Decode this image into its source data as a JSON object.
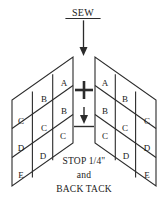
{
  "diagram": {
    "title_label": "SEW",
    "bottom_lines": [
      "STOP 1/4\"",
      "and",
      "BACK TACK"
    ],
    "colors": {
      "ink": "#2b2b2b",
      "background": "#ffffff"
    },
    "markers": {
      "plus": "+",
      "down_arrow": "down-arrow-with-stop-bar"
    },
    "left_patch": {
      "name": "left-parallelogram",
      "letters": [
        "A",
        "B",
        "B",
        "C",
        "C",
        "C",
        "D",
        "D",
        "E"
      ],
      "cells": [
        {
          "letter": "A",
          "x": 64,
          "y": 83
        },
        {
          "letter": "B",
          "x": 44,
          "y": 99
        },
        {
          "letter": "B",
          "x": 64,
          "y": 111
        },
        {
          "letter": "C",
          "x": 21,
          "y": 121
        },
        {
          "letter": "C",
          "x": 44,
          "y": 128
        },
        {
          "letter": "C",
          "x": 63,
          "y": 136
        },
        {
          "letter": "D",
          "x": 21,
          "y": 148
        },
        {
          "letter": "D",
          "x": 43,
          "y": 156
        },
        {
          "letter": "E",
          "x": 21,
          "y": 175
        }
      ]
    },
    "right_patch": {
      "name": "right-parallelogram",
      "letters": [
        "A",
        "B",
        "B",
        "C",
        "C",
        "C",
        "D",
        "D",
        "E"
      ],
      "cells": [
        {
          "letter": "A",
          "x": 105,
          "y": 83
        },
        {
          "letter": "B",
          "x": 125,
          "y": 99
        },
        {
          "letter": "B",
          "x": 105,
          "y": 111
        },
        {
          "letter": "C",
          "x": 147,
          "y": 121
        },
        {
          "letter": "C",
          "x": 125,
          "y": 128
        },
        {
          "letter": "C",
          "x": 105,
          "y": 136
        },
        {
          "letter": "D",
          "x": 147,
          "y": 148
        },
        {
          "letter": "D",
          "x": 126,
          "y": 156
        },
        {
          "letter": "E",
          "x": 147,
          "y": 175
        }
      ]
    }
  }
}
